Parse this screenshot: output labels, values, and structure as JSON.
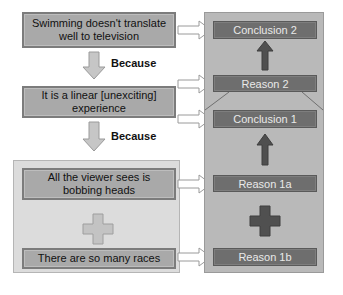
{
  "left": {
    "claim": "Swimming doesn't translate well to television",
    "because_1": "Because",
    "reason_2": "It is a linear [unexciting] experience",
    "because_2": "Because",
    "reason_1a": "All the viewer sees is bobbing heads",
    "reason_1b": "There are so many races"
  },
  "right": {
    "conclusion_2": "Conclusion 2",
    "reason_2": "Reason 2",
    "conclusion_1": "Conclusion 1",
    "reason_1a": "Reason 1a",
    "reason_1b": "Reason 1b"
  },
  "colors": {
    "left_box_fill": "#a9a9a9",
    "left_box_border": "#7c7c7c",
    "right_panel_fill": "#b9b9b9",
    "right_box_fill": "#6e6e6e",
    "dark_arrow": "#4f4f4f",
    "light_arrow": "#c6c6c6",
    "group_panel_fill": "#dcdcdc"
  }
}
